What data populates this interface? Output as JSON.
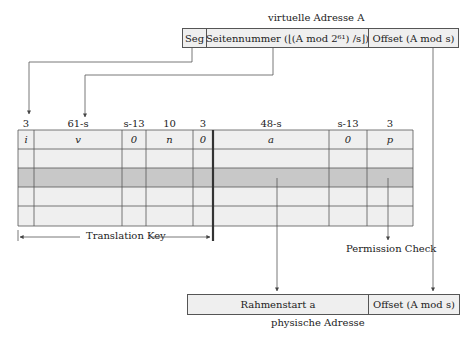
{
  "virtual_address": {
    "title": "virtuelle Adresse A",
    "fields": [
      "Seg",
      "Seitennummer (⌊(A mod 2⁶¹) /s⌋)",
      "Offset (A mod s)"
    ]
  },
  "table": {
    "bit_widths": [
      "3",
      "61-s",
      "s-13",
      "10",
      "3",
      "48-s",
      "s-13",
      "3"
    ],
    "columns": [
      "i",
      "v",
      "0",
      "n",
      "0",
      "a",
      "0",
      "p"
    ],
    "row_count": 5,
    "highlighted_row": 2
  },
  "annotations": {
    "translation_key": "Translation Key",
    "permission_check": "Permission Check"
  },
  "physical_address": {
    "title": "physische Adresse",
    "fields": [
      "Rahmenstart a",
      "Offset (A mod s)"
    ]
  },
  "colors": {
    "cell_fill": "#efefef",
    "highlight_fill": "#c8c8c8",
    "line": "#555555"
  }
}
